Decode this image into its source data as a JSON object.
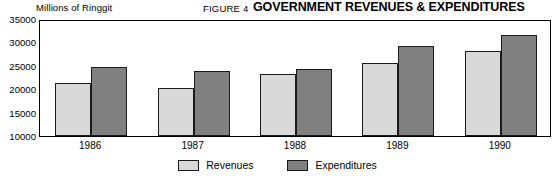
{
  "header": {
    "figure_number": "FIGURE 4",
    "title": "GOVERNMENT REVENUES & EXPENDITURES",
    "axis_unit_label": "Millions of Ringgit"
  },
  "legend": {
    "entries": [
      {
        "label": "Revenues",
        "color": "#d9d9d9",
        "name": "revenues"
      },
      {
        "label": "Expenditures",
        "color": "#808080",
        "name": "expenditures"
      }
    ]
  },
  "chart_data": {
    "type": "bar",
    "title": "GOVERNMENT REVENUES & EXPENDITURES",
    "subtitle": "FIGURE 4",
    "xlabel": "",
    "ylabel": "Millions of Ringgit",
    "ylim": [
      10000,
      35000
    ],
    "ytick_labels": [
      "35000",
      "30000",
      "25000",
      "20000",
      "15000",
      "10000"
    ],
    "ytick_values": [
      35000,
      30000,
      25000,
      20000,
      15000,
      10000
    ],
    "grid": false,
    "legend_position": "bottom-center",
    "categories": [
      "1986",
      "1987",
      "1988",
      "1989",
      "1990"
    ],
    "series": [
      {
        "name": "Revenues",
        "color": "#d9d9d9",
        "values": [
          21400,
          20300,
          23300,
          25600,
          28200
        ]
      },
      {
        "name": "Expenditures",
        "color": "#808080",
        "values": [
          24700,
          23800,
          24400,
          29200,
          31500
        ]
      }
    ]
  }
}
